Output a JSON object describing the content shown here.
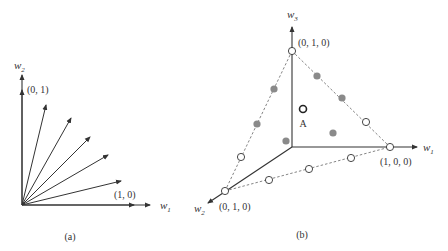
{
  "panel_a": {
    "caption": "(a)",
    "x_axis_label": "w",
    "x_axis_sub": "1",
    "y_axis_label": "w",
    "y_axis_sub": "2",
    "label_top": "(0, 1)",
    "label_right": "(1, 0)"
  },
  "panel_b": {
    "caption": "(b)",
    "w1_label": "w",
    "w1_sub": "1",
    "w2_label": "w",
    "w2_sub": "2",
    "w3_label": "w",
    "w3_sub": "3",
    "vertex_top_label": "(0, 1, 0)",
    "vertex_right_label": "(1, 0, 0)",
    "vertex_left_label": "(0, 1, 0)",
    "point_a_label": "A"
  },
  "colors": {
    "line": "#333333",
    "dashed": "#777777",
    "gray_point": "#8a8a8a"
  }
}
